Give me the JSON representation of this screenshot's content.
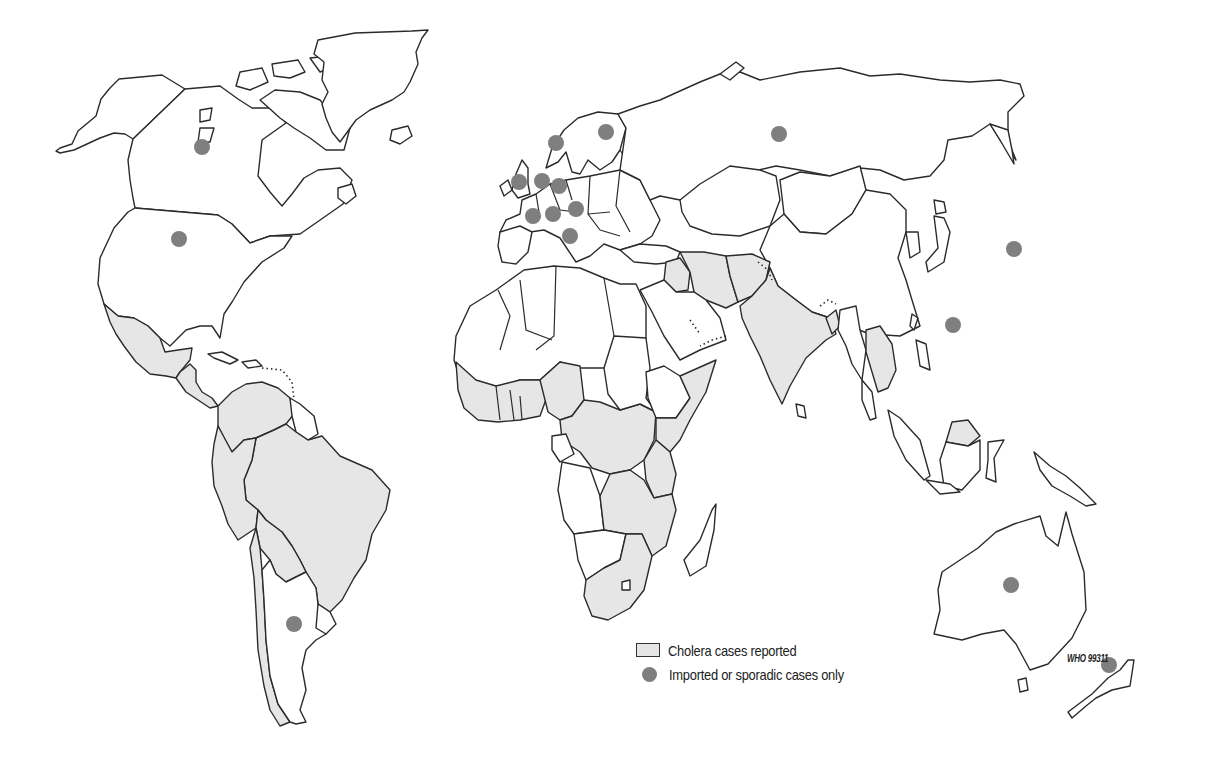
{
  "map": {
    "title": "World distribution of cholera cases",
    "colors": {
      "background": "#ffffff",
      "land": "#ffffff",
      "affected_fill": "#e6e6e6",
      "outline": "#2b2b2b",
      "sporadic_dot": "#7f7f7f"
    },
    "regions_cholera_reported": [
      "Mexico",
      "Central America",
      "South America (most countries)",
      "West Africa",
      "Central Africa",
      "East Africa",
      "Southern Africa",
      "Middle East (Iran, Iraq)",
      "Afghanistan",
      "India",
      "Southeast Asia",
      "Borneo"
    ],
    "sporadic_case_locations": [
      {
        "name": "Canada",
        "x": 202,
        "y": 147
      },
      {
        "name": "United States",
        "x": 179,
        "y": 239
      },
      {
        "name": "Argentina",
        "x": 294,
        "y": 624
      },
      {
        "name": "Norway",
        "x": 556,
        "y": 143
      },
      {
        "name": "Finland",
        "x": 606,
        "y": 132
      },
      {
        "name": "United Kingdom",
        "x": 519,
        "y": 182
      },
      {
        "name": "Netherlands",
        "x": 542,
        "y": 181
      },
      {
        "name": "Germany",
        "x": 559,
        "y": 186
      },
      {
        "name": "France",
        "x": 533,
        "y": 216
      },
      {
        "name": "Switzerland",
        "x": 553,
        "y": 214
      },
      {
        "name": "Austria",
        "x": 576,
        "y": 209
      },
      {
        "name": "Italy",
        "x": 570,
        "y": 236
      },
      {
        "name": "Russia",
        "x": 779,
        "y": 134
      },
      {
        "name": "Japan",
        "x": 1014,
        "y": 249
      },
      {
        "name": "Hong Kong",
        "x": 953,
        "y": 325
      },
      {
        "name": "Australia",
        "x": 1011,
        "y": 585
      },
      {
        "name": "New Zealand",
        "x": 1109,
        "y": 665
      }
    ]
  },
  "legend": {
    "items": [
      {
        "symbol": "light-grey-box",
        "label": "Cholera cases reported"
      },
      {
        "symbol": "grey-dot",
        "label": "Imported or sporadic cases only"
      }
    ]
  },
  "source_code": "WHO 99311"
}
